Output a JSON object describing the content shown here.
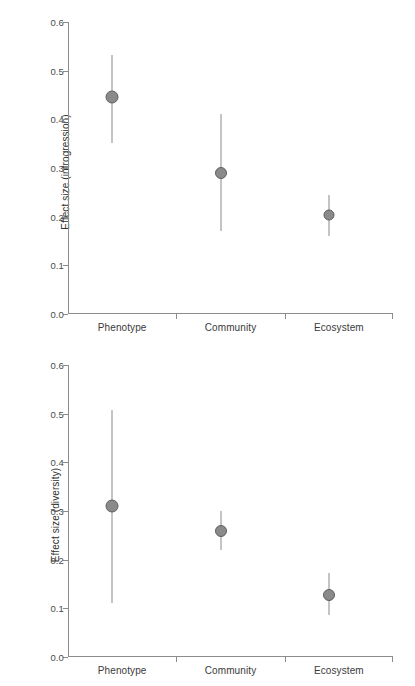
{
  "figure": {
    "background_color": "#ffffff",
    "axis_color": "#8c8c8c",
    "marker_fill": "#8a8a8a",
    "marker_edge": "#5e5e5e"
  },
  "panels": [
    {
      "id": "panel-top",
      "ylabel": "Effect size (introgression)",
      "xlabel": "",
      "ticks": [
        "0.0",
        "0.1",
        "0.2",
        "0.3",
        "0.4",
        "0.5",
        "0.6"
      ],
      "categories": [
        "Phenotype",
        "Community",
        "Ecosystem"
      ]
    },
    {
      "id": "panel-bottom",
      "ylabel": "Effect size (diversity)",
      "xlabel": "",
      "ticks": [
        "0.0",
        "0.1",
        "0.2",
        "0.3",
        "0.4",
        "0.5",
        "0.6"
      ],
      "categories": [
        "Phenotype",
        "Community",
        "Ecosystem"
      ]
    }
  ],
  "chart_data": [
    {
      "type": "scatter",
      "panel": "top",
      "title": "",
      "xlabel": "",
      "ylabel": "Effect size (introgression)",
      "categories": [
        "Phenotype",
        "Community",
        "Ecosystem"
      ],
      "values": [
        0.445,
        0.29,
        0.203
      ],
      "error_low": [
        0.352,
        0.17,
        0.16
      ],
      "error_high": [
        0.532,
        0.41,
        0.245
      ],
      "ylim": [
        0.0,
        0.6
      ],
      "yticks": [
        0.0,
        0.1,
        0.2,
        0.3,
        0.4,
        0.5,
        0.6
      ],
      "ytick_labels": [
        "0.0",
        "0.1",
        "0.2",
        "0.3",
        "0.4",
        "0.5",
        "0.6"
      ],
      "grid": false,
      "legend": "none",
      "marker_sizes": [
        13,
        12,
        11
      ]
    },
    {
      "type": "scatter",
      "panel": "bottom",
      "title": "",
      "xlabel": "",
      "ylabel": "Effect size (diversity)",
      "categories": [
        "Phenotype",
        "Community",
        "Ecosystem"
      ],
      "values": [
        0.31,
        0.258,
        0.128
      ],
      "error_low": [
        0.11,
        0.22,
        0.086
      ],
      "error_high": [
        0.508,
        0.3,
        0.172
      ],
      "ylim": [
        0.0,
        0.6
      ],
      "yticks": [
        0.0,
        0.1,
        0.2,
        0.3,
        0.4,
        0.5,
        0.6
      ],
      "ytick_labels": [
        "0.0",
        "0.1",
        "0.2",
        "0.3",
        "0.4",
        "0.5",
        "0.6"
      ],
      "grid": false,
      "legend": "none",
      "marker_sizes": [
        13,
        12,
        12
      ]
    }
  ]
}
